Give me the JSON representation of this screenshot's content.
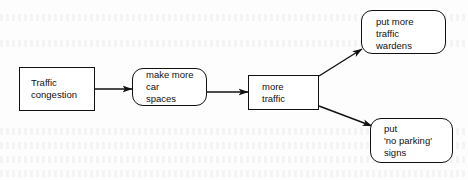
{
  "diagram": {
    "type": "flowchart",
    "colors": {
      "stroke": "#111111",
      "text": "#111111",
      "background": "#fdfdfd"
    },
    "nodes": [
      {
        "id": "n1",
        "shape": "rectangle",
        "lines": [
          "Traffic",
          "congestion"
        ]
      },
      {
        "id": "n2",
        "shape": "rounded-rectangle",
        "lines": [
          "make more",
          "car",
          "spaces"
        ]
      },
      {
        "id": "n3",
        "shape": "rectangle",
        "lines": [
          "more",
          "traffic"
        ]
      },
      {
        "id": "n4",
        "shape": "rounded-rectangle",
        "lines": [
          "put more",
          "traffic",
          "wardens"
        ]
      },
      {
        "id": "n5",
        "shape": "rounded-rectangle",
        "lines": [
          "put",
          "'no parking'",
          "signs"
        ]
      }
    ],
    "edges": [
      {
        "from": "n1",
        "to": "n2"
      },
      {
        "from": "n2",
        "to": "n3"
      },
      {
        "from": "n3",
        "to": "n4"
      },
      {
        "from": "n3",
        "to": "n5"
      }
    ]
  }
}
